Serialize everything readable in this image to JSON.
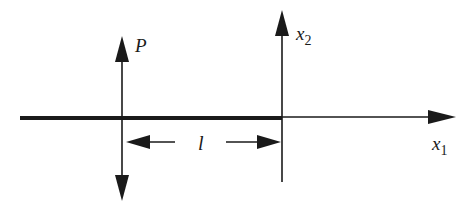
{
  "diagram": {
    "type": "beam-coordinate-schematic",
    "colors": {
      "ink": "#1a1a1a",
      "background": "#ffffff"
    },
    "labels": {
      "force": "P",
      "x2_base": "x",
      "x2_sub": "2",
      "x1_base": "x",
      "x1_sub": "1",
      "length": "l"
    },
    "elements": [
      {
        "id": "beam",
        "description": "thick horizontal beam"
      },
      {
        "id": "x1-axis",
        "description": "horizontal axis arrow to the right"
      },
      {
        "id": "x2-axis",
        "description": "vertical axis arrow upward"
      },
      {
        "id": "force-P",
        "description": "double-headed vertical force arrow"
      },
      {
        "id": "length-dimension",
        "description": "dimension arrows with label l"
      }
    ]
  }
}
